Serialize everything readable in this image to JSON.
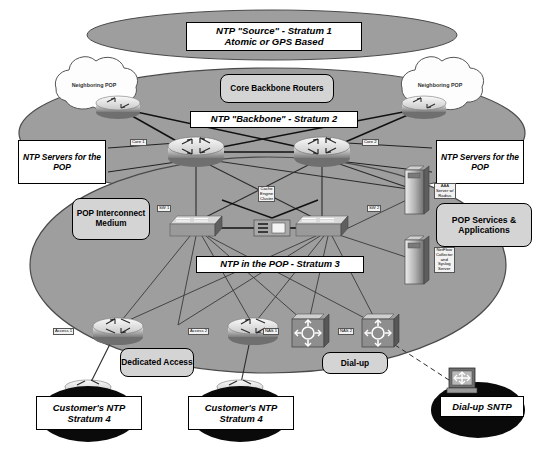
{
  "banners": {
    "stratum1": "NTP \"Source\" - Stratum 1\nAtomic or GPS Based",
    "stratum2": "NTP \"Backbone\" - Stratum 2",
    "stratum3": "NTP in the POP - Stratum 3"
  },
  "rounded_labels": {
    "core_backbone_routers": "Core Backbone\nRouters",
    "pop_interconnect": "POP\nInterconnect\nMedium",
    "pop_services": "POP Services\n&\nApplications",
    "dedicated_access": "Dedicated\nAccess",
    "dialup": "Dial-up"
  },
  "callouts": {
    "ntp_servers_left": "NTP\nServers for\nthe POP",
    "ntp_servers_right": "NTP\nServers for\nthe POP"
  },
  "clouds": [
    {
      "name": "neighboring-pop-left",
      "label": "Neighboring\nPOP"
    },
    {
      "name": "neighboring-pop-right",
      "label": "Neighboring\nPOP"
    }
  ],
  "devices": [
    {
      "name": "core-router-1",
      "label": "Core 1",
      "type": "router"
    },
    {
      "name": "core-router-2",
      "label": "Core 2",
      "type": "router"
    },
    {
      "name": "switch-1",
      "label": "SW 1",
      "type": "switch"
    },
    {
      "name": "switch-2",
      "label": "SW 2",
      "type": "switch"
    },
    {
      "name": "cache-engine-cluster",
      "label": "Cache\nEngine\nCluster",
      "type": "cache"
    },
    {
      "name": "aaa-server",
      "label": "AAA\nServer w/\nRadius",
      "type": "server"
    },
    {
      "name": "netflow-server",
      "label": "NetFlow\nCollector\nand\nSyslog\nServer",
      "type": "server"
    },
    {
      "name": "access-router-1",
      "label": "Access 1",
      "type": "router"
    },
    {
      "name": "access-router-2",
      "label": "Access 2",
      "type": "router"
    },
    {
      "name": "nas-1",
      "label": "NAS 1",
      "type": "access-server"
    },
    {
      "name": "nas-2",
      "label": "NAS 2",
      "type": "access-server"
    }
  ],
  "customers": [
    {
      "name": "customer-ntp-left",
      "label": "Customer's NTP\nStratum 4"
    },
    {
      "name": "customer-ntp-right",
      "label": "Customer's NTP\nStratum 4"
    },
    {
      "name": "dialup-sntp",
      "label": "Dial-up SNTP"
    }
  ],
  "colors": {
    "ellipse_fill": "#9e9e9e",
    "ellipse_stroke": "#4a4a4a",
    "cloud_fill": "#fdfdfd",
    "cloud_stroke": "#555555",
    "black_ellipse": "#0a0a0a",
    "link": "#1a1a1a",
    "rounded_fill": "#d4d4d4"
  }
}
